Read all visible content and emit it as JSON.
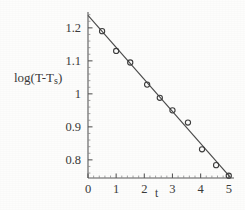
{
  "chart_data": {
    "type": "scatter",
    "title": "",
    "xlabel": "t",
    "ylabel": "log(T-Ts)",
    "ylabel_parts": {
      "main": "log(T-T",
      "sub": "s",
      "tail": ")"
    },
    "xlim": [
      0,
      5.15
    ],
    "ylim": [
      0.745,
      1.245
    ],
    "grid": false,
    "legend": "none",
    "x_ticks": [
      0,
      1,
      2,
      3,
      4,
      5
    ],
    "x_tick_labels": [
      "0",
      "1",
      "2",
      "3",
      "4",
      "5"
    ],
    "y_ticks": [
      0.8,
      0.9,
      1.0,
      1.1,
      1.2
    ],
    "y_tick_labels": [
      "0.8",
      "0.9",
      "1",
      "1.1",
      "1.2"
    ],
    "x_minor_ticks": [
      0.2,
      0.4,
      0.6,
      0.8,
      1.2,
      1.4,
      1.6,
      1.8,
      2.2,
      2.4,
      2.6,
      2.8,
      3.2,
      3.4,
      3.6,
      3.8,
      4.2,
      4.4,
      4.6,
      4.8
    ],
    "y_minor_ticks": [
      0.76,
      0.78,
      0.82,
      0.84,
      0.86,
      0.88,
      0.92,
      0.94,
      0.96,
      0.98,
      1.02,
      1.04,
      1.06,
      1.08,
      1.12,
      1.14,
      1.16,
      1.18,
      1.22,
      1.24
    ],
    "series": [
      {
        "name": "log(T-Ts) data",
        "marker": "open-circle",
        "points": [
          {
            "x": 0.5,
            "y": 1.19
          },
          {
            "x": 1.0,
            "y": 1.13
          },
          {
            "x": 1.5,
            "y": 1.095
          },
          {
            "x": 2.1,
            "y": 1.028
          },
          {
            "x": 2.55,
            "y": 0.988
          },
          {
            "x": 3.0,
            "y": 0.95
          },
          {
            "x": 3.55,
            "y": 0.913
          },
          {
            "x": 4.05,
            "y": 0.832
          },
          {
            "x": 4.55,
            "y": 0.784
          },
          {
            "x": 5.0,
            "y": 0.752
          }
        ]
      }
    ],
    "fit_line": {
      "name": "least-squares fit",
      "x0": 0.0,
      "y0": 1.238,
      "x1": 5.05,
      "y1": 0.748
    },
    "colors": {
      "axis": "#5a5a5a",
      "line": "#4a4a4a",
      "marker": "#3d3d3d",
      "text": "#3a3a3a",
      "background": "#fdfdfc"
    }
  }
}
